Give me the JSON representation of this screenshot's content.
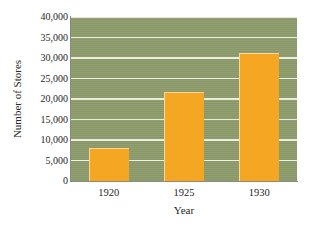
{
  "chart_data": {
    "type": "bar",
    "title": "",
    "subtitle": "",
    "xlabel": "Year",
    "ylabel": "Number of Stores",
    "categories": [
      "1920",
      "1925",
      "1930"
    ],
    "values": [
      8000,
      21800,
      31200
    ],
    "series": [
      {
        "name": "Number of Stores",
        "values": [
          8000,
          21800,
          31200
        ]
      }
    ],
    "ylim": [
      0,
      40000
    ],
    "ytick_values": [
      0,
      5000,
      10000,
      15000,
      20000,
      25000,
      30000,
      35000,
      40000
    ],
    "ytick_labels": [
      "0",
      "5,000",
      "10,000",
      "15,000",
      "20,000",
      "25,000",
      "30,000",
      "35,000",
      "40,000"
    ],
    "xtick_labels": [
      "1920",
      "1925",
      "1930"
    ],
    "grid": true,
    "grid_axis": "y",
    "legend": false,
    "legend_position": "none",
    "annotations": [],
    "colors": {
      "bar": "#f5a623",
      "bar_highlight": "#fbd89a",
      "plot_background": "#8d9c6c",
      "gridline": "#f2f0e2",
      "axis": "#8a8a7a",
      "text": "#262626",
      "page_background": "#ffffff"
    }
  }
}
